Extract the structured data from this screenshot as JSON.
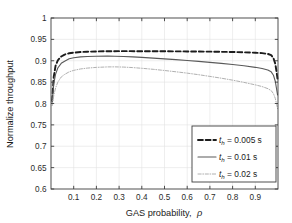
{
  "chart_data": {
    "type": "line",
    "title": "",
    "xlabel": "GAS probability, ρ",
    "ylabel": "Normalize throughput",
    "xlim": [
      0,
      1
    ],
    "ylim": [
      0.6,
      1
    ],
    "xticks": [
      0.1,
      0.2,
      0.3,
      0.4,
      0.5,
      0.6,
      0.7,
      0.8,
      0.9
    ],
    "xticklabels": [
      "0.1",
      "0.2",
      "0.3",
      "0.4",
      "0.5",
      "0.6",
      "0.7",
      "0.8",
      "0.9"
    ],
    "yticks": [
      0.6,
      0.65,
      0.7,
      0.75,
      0.8,
      0.85,
      0.9,
      0.95,
      1
    ],
    "yticklabels": [
      "0.6",
      "0.65",
      "0.7",
      "0.75",
      "0.8",
      "0.85",
      "0.9",
      "0.95",
      "1"
    ],
    "grid": true,
    "legend_position": "lower right",
    "series": [
      {
        "name": "t_h = 0.005 s",
        "label_main": "t",
        "label_sub": "h",
        "label_rest": " = 0.005 s",
        "style": "dashed",
        "color": "#1c1c1c",
        "width": 1.9,
        "x": [
          0.005,
          0.012,
          0.02,
          0.03,
          0.045,
          0.06,
          0.08,
          0.1,
          0.13,
          0.16,
          0.2,
          0.25,
          0.3,
          0.35,
          0.4,
          0.45,
          0.5,
          0.55,
          0.6,
          0.65,
          0.7,
          0.75,
          0.8,
          0.85,
          0.9,
          0.93,
          0.955,
          0.97,
          0.98,
          0.988,
          0.994,
          0.998
        ],
        "y": [
          0.806,
          0.862,
          0.888,
          0.901,
          0.91,
          0.9145,
          0.9175,
          0.919,
          0.9203,
          0.9212,
          0.9218,
          0.9222,
          0.9224,
          0.9224,
          0.9223,
          0.9222,
          0.9221,
          0.922,
          0.9218,
          0.9216,
          0.9213,
          0.9209,
          0.9204,
          0.9198,
          0.9188,
          0.9178,
          0.916,
          0.913,
          0.906,
          0.893,
          0.873,
          0.857
        ]
      },
      {
        "name": "t_h = 0.01 s",
        "label_main": "t",
        "label_sub": "h",
        "label_rest": " = 0.01 s",
        "style": "solid",
        "color": "#5a5a5a",
        "width": 1.1,
        "x": [
          0.005,
          0.012,
          0.02,
          0.03,
          0.045,
          0.06,
          0.08,
          0.1,
          0.13,
          0.16,
          0.2,
          0.25,
          0.28,
          0.32,
          0.36,
          0.4,
          0.45,
          0.5,
          0.55,
          0.6,
          0.65,
          0.7,
          0.75,
          0.8,
          0.85,
          0.9,
          0.93,
          0.955,
          0.97,
          0.98,
          0.988,
          0.994,
          0.998
        ],
        "y": [
          0.8,
          0.846,
          0.868,
          0.883,
          0.894,
          0.899,
          0.9045,
          0.907,
          0.909,
          0.91,
          0.9106,
          0.9108,
          0.9107,
          0.91,
          0.909,
          0.9078,
          0.9062,
          0.9044,
          0.9026,
          0.9006,
          0.8985,
          0.8962,
          0.8938,
          0.8912,
          0.8882,
          0.8846,
          0.8818,
          0.8782,
          0.874,
          0.866,
          0.852,
          0.833,
          0.82
        ]
      },
      {
        "name": "t_h = 0.02 s",
        "label_main": "t",
        "label_sub": "h",
        "label_rest": " = 0.02 s",
        "style": "dashdot",
        "color": "#b0b0b0",
        "width": 1.0,
        "x": [
          0.005,
          0.012,
          0.02,
          0.03,
          0.045,
          0.06,
          0.08,
          0.1,
          0.13,
          0.16,
          0.2,
          0.25,
          0.28,
          0.32,
          0.36,
          0.4,
          0.45,
          0.5,
          0.55,
          0.6,
          0.65,
          0.7,
          0.75,
          0.8,
          0.85,
          0.9,
          0.93,
          0.955,
          0.97,
          0.98,
          0.988,
          0.994,
          0.998
        ],
        "y": [
          0.795,
          0.818,
          0.836,
          0.85,
          0.862,
          0.868,
          0.874,
          0.8775,
          0.8808,
          0.8828,
          0.8845,
          0.8856,
          0.8857,
          0.8852,
          0.884,
          0.8824,
          0.88,
          0.8772,
          0.8742,
          0.871,
          0.8674,
          0.8634,
          0.8592,
          0.8546,
          0.8494,
          0.8436,
          0.8396,
          0.8348,
          0.8302,
          0.823,
          0.812,
          0.798,
          0.788
        ]
      }
    ]
  },
  "legend": {
    "items": [
      {
        "text": "= 0.005 s",
        "symbol": "t",
        "sub": "h"
      },
      {
        "text": "= 0.01 s",
        "symbol": "t",
        "sub": "h"
      },
      {
        "text": "= 0.02 s",
        "symbol": "t",
        "sub": "h"
      }
    ]
  },
  "axes": {
    "x_title": "GAS probability,",
    "x_title_symbol": "ρ",
    "y_title": "Normalize throughput"
  },
  "colors": {
    "frame": "#3c3c3c",
    "grid": "#e2e2e2",
    "background": "#ffffff",
    "series_1": "#1c1c1c",
    "series_2": "#5a5a5a",
    "series_3": "#b0b0b0"
  }
}
